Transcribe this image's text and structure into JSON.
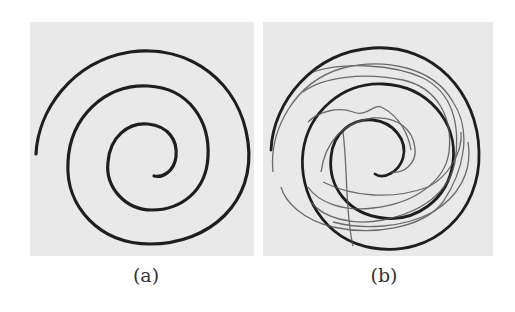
{
  "figure": {
    "panels": [
      {
        "id": "a",
        "label": "(a)",
        "content": "reference spiral drawing"
      },
      {
        "id": "b",
        "label": "(b)",
        "content": "reference spiral overlaid with traced attempts"
      }
    ],
    "colors": {
      "background": "#e9e9e9",
      "spiral": "#1e1e1e",
      "trace": "#555555"
    }
  }
}
